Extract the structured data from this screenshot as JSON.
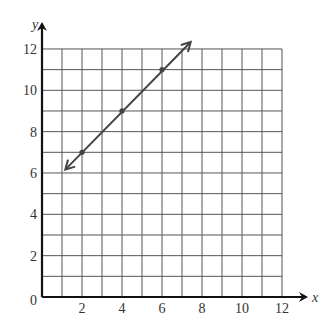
{
  "chart_data": {
    "type": "line",
    "title": "",
    "xlabel": "x",
    "ylabel": "y",
    "xlim": [
      0,
      12
    ],
    "ylim": [
      0,
      12
    ],
    "grid": true,
    "grid_step": 1,
    "x_ticks": [
      2,
      4,
      6,
      8,
      10,
      12
    ],
    "y_ticks": [
      2,
      4,
      6,
      8,
      10,
      12
    ],
    "origin_label": "0",
    "series": [
      {
        "name": "line",
        "equation": "y = x + 5",
        "points": [
          {
            "x": 2,
            "y": 7
          },
          {
            "x": 4,
            "y": 9
          },
          {
            "x": 6,
            "y": 11
          }
        ],
        "extends_both_directions": true,
        "arrow_start": {
          "x": 1.2,
          "y": 6.2
        },
        "arrow_end": {
          "x": 7.4,
          "y": 12.3
        }
      }
    ]
  },
  "colors": {
    "axis": "#111111",
    "grid": "#555555",
    "line": "#444444",
    "text": "#333333"
  }
}
